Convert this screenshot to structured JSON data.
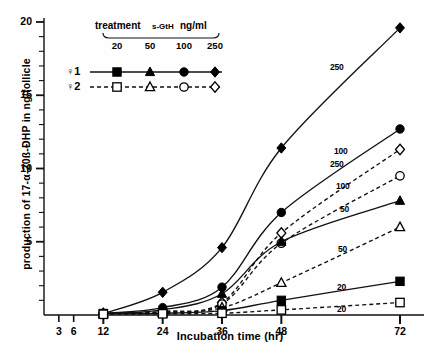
{
  "figure": {
    "ylabel": "production of 17-α-20ß-ÐHP in ng/follicle",
    "xlabel": "Incubation time (hr)"
  },
  "legend": {
    "header": "treatment",
    "hormone": "s-GtH",
    "units": "ng/ml",
    "doses": [
      "20",
      "50",
      "100",
      "250"
    ],
    "rows": [
      {
        "name": "♀1",
        "style": "solid",
        "fill": "filled"
      },
      {
        "name": "♀2",
        "style": "dashed",
        "fill": "open"
      }
    ]
  },
  "chart_data": {
    "type": "line",
    "title": "",
    "xlabel": "Incubation time (hr)",
    "ylabel": "production of 17-α-20ß-ÐHP in ng/follicle",
    "xlim": [
      0,
      72
    ],
    "ylim": [
      0,
      20
    ],
    "xticks": [
      3,
      6,
      12,
      24,
      36,
      48,
      72
    ],
    "xtick_labels": [
      "3",
      "6",
      "12",
      "24",
      "36",
      "48",
      "72"
    ],
    "yticks": [
      5,
      10,
      15,
      20
    ],
    "ytick_labels": [
      "5",
      "10",
      "15",
      "20"
    ],
    "yminor_step": 1,
    "grid": false,
    "legend_position": "upper-left",
    "x": [
      12,
      24,
      36,
      48,
      72
    ],
    "series": [
      {
        "name": "♀1 250 ng/ml",
        "female": "♀1",
        "dose": 250,
        "line": "solid",
        "marker": "diamond-filled",
        "label": "250",
        "values": [
          0.1,
          1.55,
          4.6,
          11.4,
          19.6
        ]
      },
      {
        "name": "♀1 100 ng/ml",
        "female": "♀1",
        "dose": 100,
        "line": "solid",
        "marker": "circle-filled",
        "label": "100",
        "values": [
          0.1,
          0.5,
          1.9,
          7.0,
          12.7
        ]
      },
      {
        "name": "♀2 250 ng/ml",
        "female": "♀2",
        "dose": 250,
        "line": "dashed",
        "marker": "diamond-open",
        "label": "250",
        "values": [
          0.1,
          0.25,
          0.85,
          5.6,
          11.3
        ]
      },
      {
        "name": "♀2 100 ng/ml",
        "female": "♀2",
        "dose": 100,
        "line": "dashed",
        "marker": "circle-open",
        "label": "100",
        "values": [
          0.1,
          0.2,
          0.75,
          4.9,
          9.5
        ]
      },
      {
        "name": "♀1 50 ng/ml",
        "female": "♀1",
        "dose": 50,
        "line": "solid",
        "marker": "triangle-filled",
        "label": "50",
        "values": [
          0.1,
          0.35,
          1.45,
          5.0,
          7.8
        ]
      },
      {
        "name": "♀2 50 ng/ml",
        "female": "♀2",
        "dose": 50,
        "line": "dashed",
        "marker": "triangle-open",
        "label": "50",
        "values": [
          0.1,
          0.15,
          0.5,
          2.2,
          6.0
        ]
      },
      {
        "name": "♀1 20 ng/ml",
        "female": "♀1",
        "dose": 20,
        "line": "solid",
        "marker": "square-filled",
        "label": "20",
        "values": [
          0.1,
          0.12,
          0.3,
          1.0,
          2.3
        ]
      },
      {
        "name": "♀2 20 ng/ml",
        "female": "♀2",
        "dose": 20,
        "line": "dashed",
        "marker": "square-open",
        "label": "20",
        "values": [
          0.05,
          0.08,
          0.12,
          0.35,
          0.85
        ]
      }
    ],
    "curve_tags": [
      {
        "text": "250",
        "x": 330,
        "y": 62
      },
      {
        "text": "100",
        "x": 334,
        "y": 146
      },
      {
        "text": "250",
        "x": 330,
        "y": 159
      },
      {
        "text": "100",
        "x": 336,
        "y": 181
      },
      {
        "text": "50",
        "x": 340,
        "y": 204
      },
      {
        "text": "50",
        "x": 338,
        "y": 244
      },
      {
        "text": "20",
        "x": 337,
        "y": 282
      },
      {
        "text": "20",
        "x": 337,
        "y": 304
      }
    ]
  }
}
